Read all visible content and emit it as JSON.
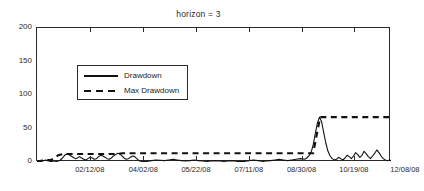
{
  "chart_data": {
    "type": "line",
    "title": "horizon = 3",
    "xlabel": "",
    "ylabel": "",
    "ylim": [
      0,
      200
    ],
    "yticks": [
      0,
      50,
      100,
      150,
      200
    ],
    "xticks": [
      "02/12/08",
      "04/02/08",
      "05/22/08",
      "07/11/08",
      "08/30/08",
      "10/19/08",
      "12/08/08"
    ],
    "xtick_positions": [
      0.152,
      0.303,
      0.452,
      0.601,
      0.75,
      0.898,
      1.042
    ],
    "grid": false,
    "legend_position": "upper left",
    "series": [
      {
        "name": "Drawdown",
        "style": "solid",
        "color": "#111111",
        "x": [
          0.0,
          0.006,
          0.012,
          0.018,
          0.024,
          0.03,
          0.036,
          0.042,
          0.048,
          0.054,
          0.06,
          0.066,
          0.072,
          0.078,
          0.084,
          0.09,
          0.096,
          0.102,
          0.108,
          0.114,
          0.12,
          0.126,
          0.132,
          0.138,
          0.144,
          0.15,
          0.156,
          0.162,
          0.168,
          0.174,
          0.18,
          0.186,
          0.192,
          0.198,
          0.204,
          0.21,
          0.216,
          0.222,
          0.228,
          0.234,
          0.24,
          0.246,
          0.252,
          0.258,
          0.264,
          0.27,
          0.276,
          0.282,
          0.288,
          0.294,
          0.3,
          0.312,
          0.324,
          0.336,
          0.348,
          0.36,
          0.372,
          0.384,
          0.396,
          0.408,
          0.42,
          0.432,
          0.444,
          0.456,
          0.468,
          0.48,
          0.492,
          0.504,
          0.516,
          0.528,
          0.54,
          0.552,
          0.564,
          0.576,
          0.588,
          0.6,
          0.612,
          0.624,
          0.636,
          0.648,
          0.66,
          0.672,
          0.684,
          0.696,
          0.708,
          0.72,
          0.732,
          0.744,
          0.756,
          0.762,
          0.768,
          0.774,
          0.78,
          0.786,
          0.792,
          0.798,
          0.804,
          0.81,
          0.816,
          0.822,
          0.828,
          0.834,
          0.84,
          0.846,
          0.852,
          0.858,
          0.864,
          0.87,
          0.876,
          0.882,
          0.888,
          0.894,
          0.9,
          0.906,
          0.912,
          0.918,
          0.924,
          0.93,
          0.936,
          0.942,
          0.948,
          0.954,
          0.96,
          0.966,
          0.972,
          0.978,
          0.984,
          0.99,
          0.996,
          1.0
        ],
        "y": [
          0.0,
          0.5,
          1.0,
          2.0,
          3.0,
          2.0,
          1.0,
          0.5,
          0.0,
          0.5,
          1.5,
          3.0,
          6.0,
          10.0,
          12.0,
          11.0,
          9.0,
          7.0,
          5.0,
          6.0,
          8.0,
          6.0,
          4.0,
          3.0,
          5.0,
          7.0,
          6.0,
          4.0,
          5.0,
          8.0,
          10.0,
          9.0,
          7.0,
          5.0,
          4.0,
          6.0,
          9.0,
          11.0,
          13.0,
          12.0,
          9.0,
          6.0,
          4.0,
          5.0,
          7.0,
          9.0,
          8.0,
          5.0,
          2.0,
          1.0,
          0.5,
          1.0,
          2.0,
          3.0,
          2.5,
          2.0,
          3.0,
          4.0,
          3.0,
          2.0,
          1.5,
          2.0,
          3.0,
          2.0,
          1.5,
          1.0,
          1.5,
          2.0,
          1.5,
          1.0,
          1.5,
          2.0,
          1.0,
          0.5,
          1.0,
          2.0,
          3.0,
          2.0,
          1.0,
          1.5,
          2.0,
          3.0,
          4.0,
          3.0,
          2.0,
          3.0,
          4.0,
          5.0,
          4.0,
          6.0,
          9.0,
          14.0,
          25.0,
          42.0,
          58.0,
          67.0,
          60.0,
          44.0,
          28.0,
          16.0,
          9.0,
          5.0,
          3.0,
          4.0,
          7.0,
          5.0,
          3.0,
          6.0,
          10.0,
          8.0,
          5.0,
          9.0,
          14.0,
          11.0,
          7.0,
          10.0,
          16.0,
          12.0,
          8.0,
          5.0,
          9.0,
          13.0,
          18.0,
          14.0,
          9.0,
          5.0,
          3.0,
          2.0,
          3.0,
          2.0
        ]
      },
      {
        "name": "Max Drawdown",
        "style": "dashed",
        "color": "#111111",
        "x": [
          0.0,
          0.02,
          0.04,
          0.06,
          0.075,
          0.09,
          0.23,
          0.24,
          0.78,
          0.79,
          0.8,
          1.0
        ],
        "y": [
          0.0,
          3.0,
          3.0,
          10.0,
          12.0,
          12.0,
          12.0,
          13.0,
          13.0,
          40.0,
          67.0,
          67.0
        ]
      }
    ]
  }
}
